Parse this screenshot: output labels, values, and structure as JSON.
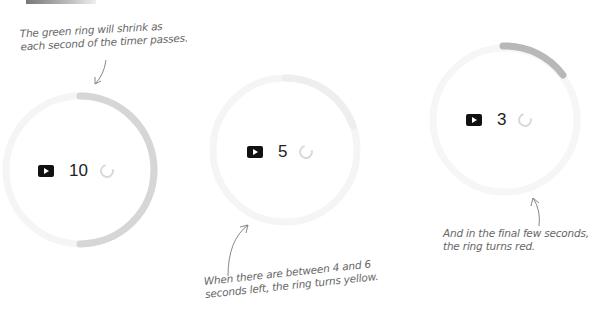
{
  "annotations": {
    "green": [
      "The green ring will shrink as",
      "each second of the timer passes."
    ],
    "yellow": [
      "When there are between 4 and 6",
      "seconds left, the ring turns yellow."
    ],
    "red": [
      "And in the final few seconds,",
      "the ring turns red."
    ]
  },
  "timers": [
    {
      "count": "10",
      "state": "green"
    },
    {
      "count": "5",
      "state": "yellow"
    },
    {
      "count": "3",
      "state": "red"
    }
  ],
  "icons": {
    "play": "play-icon",
    "reset": "reset-icon"
  },
  "colors": {
    "track": "#f4f4f4",
    "progress": "#d0d0d0",
    "progress_dark": "#b4b4b4"
  }
}
